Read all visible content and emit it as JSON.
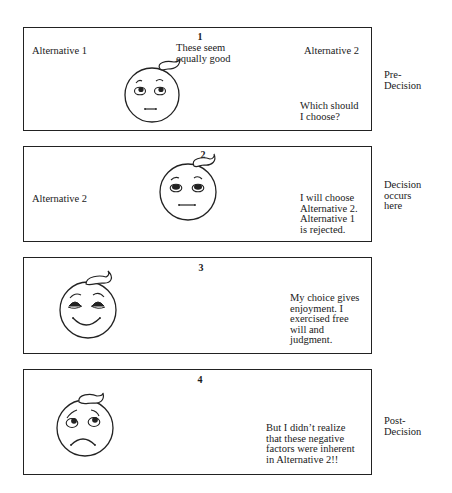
{
  "panels": [
    {
      "number": "1",
      "face_expression": "uncertain",
      "alternative_left": "Alternative 1",
      "thought_top": [
        "These seem",
        "equally good"
      ],
      "alternative_right": "Alternative 2",
      "thought_bottom": [
        "Which should",
        "I choose?"
      ]
    },
    {
      "number": "2",
      "face_expression": "neutral",
      "alternative_left": "Alternative 2",
      "thought": [
        "I will choose",
        "Alternative 2.",
        "Alternative 1",
        "is rejected."
      ]
    },
    {
      "number": "3",
      "face_expression": "happy",
      "thought": [
        "My choice gives",
        "enjoyment. I",
        "exercised free",
        "will and",
        "judgment."
      ]
    },
    {
      "number": "4",
      "face_expression": "sad",
      "thought": [
        "But I didn’t realize",
        "that these negative",
        "factors were inherent",
        "in Alternative 2!!"
      ]
    }
  ],
  "stages": {
    "pre": [
      "Pre-",
      "Decision"
    ],
    "decision": [
      "Decision",
      "occurs",
      "here"
    ],
    "post": [
      "Post-",
      "Decision"
    ]
  }
}
